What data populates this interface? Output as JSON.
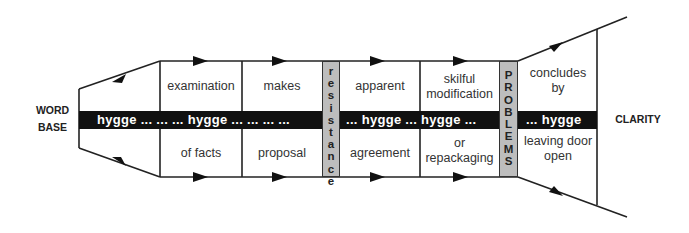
{
  "diagram": {
    "left_label": [
      "WORD",
      "BASE"
    ],
    "right_label": "CLARITY",
    "band_segments": [
      "hygge ... ... ... hygge ... ... ... ...",
      "... hygge ... hygge ...",
      "... hygge"
    ],
    "cells": {
      "top": [
        "examination",
        "makes",
        "apparent",
        "skilful modification",
        "concludes by"
      ],
      "bottom": [
        "of facts",
        "proposal",
        "agreement",
        "or repackaging",
        "leaving door open"
      ]
    },
    "barrier_1": {
      "label": "resistance",
      "letters": [
        "r",
        "e",
        "s",
        "i",
        "s",
        "t",
        "a",
        "n",
        "c",
        "e"
      ]
    },
    "barrier_2": {
      "label": "PROBLEMS",
      "letters": [
        "P",
        "R",
        "O",
        "B",
        "L",
        "E",
        "M",
        "S"
      ]
    },
    "colors": {
      "band": "#111111",
      "barrier": "#bdbdbd",
      "line": "#222222"
    }
  }
}
